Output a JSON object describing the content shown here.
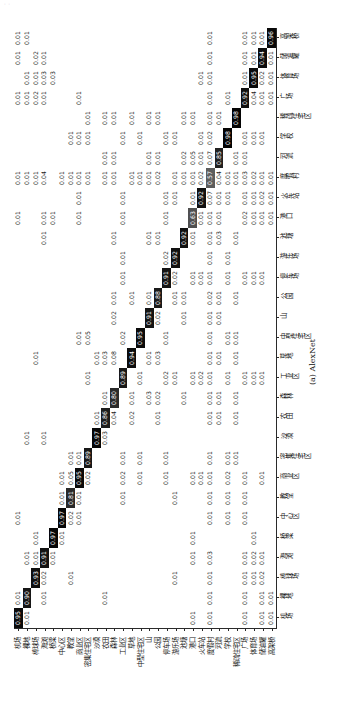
{
  "watermark_text": "  ·                                   ·            ",
  "figure": {
    "caption": "(a) AlexNet",
    "orientation_note": "rotated",
    "accent_dark": "#000000",
    "accent_light": "#ffffff"
  },
  "chart_data": {
    "type": "heatmap",
    "title": "",
    "subtitle": "(a) AlexNet",
    "xlabel": "",
    "ylabel": "",
    "grid": false,
    "legend": "none",
    "colormap": "greys",
    "vmin": 0,
    "vmax": 1,
    "categories": [
      "机场",
      "裸地",
      "棒球场",
      "海滩",
      "桥梁",
      "中心区",
      "教堂",
      "商业区",
      "密集住宅区",
      "沙漠",
      "农田",
      "森林",
      "工业区",
      "草地",
      "中型住宅区",
      "山",
      "公园",
      "停车场",
      "游乐场",
      "池塘",
      "港口",
      "火车站",
      "度假村",
      "河流",
      "学校",
      "稀疏住宅区",
      "广场",
      "体育场",
      "储油罐",
      "高架桥"
    ],
    "x_categories": [
      "机场",
      "裸地",
      "棒球场",
      "海滩",
      "桥梁",
      "中心区",
      "教堂",
      "商业区",
      "密集住宅区",
      "沙漠",
      "农田",
      "森林",
      "工业区",
      "草地",
      "中型住宅区",
      "山",
      "公园",
      "停车场",
      "游乐场",
      "池塘",
      "港口",
      "火车站",
      "度假村",
      "河流",
      "学校",
      "稀疏住宅区",
      "广场",
      "体育场",
      "储油罐",
      "高架桥"
    ],
    "y_categories": [
      "机场",
      "裸地",
      "棒球场",
      "海滩",
      "桥梁",
      "中心区",
      "教堂",
      "商业区",
      "密集住宅区",
      "沙漠",
      "农田",
      "森林",
      "工业区",
      "草地",
      "中型住宅区",
      "山",
      "公园",
      "停车场",
      "游乐场",
      "池塘",
      "港口",
      "火车站",
      "度假村",
      "河流",
      "学校",
      "稀疏住宅区",
      "广场",
      "体育场",
      "储油罐",
      "高架桥"
    ],
    "diagonal_values": [
      0.95,
      0.9,
      0.93,
      0.91,
      0.97,
      0.97,
      0.81,
      0.95,
      0.89,
      0.97,
      0.86,
      0.8,
      0.89,
      0.94,
      0.95,
      0.91,
      0.88,
      0.91,
      0.92,
      0.92,
      0.63,
      0.92,
      0.57,
      0.85,
      0.98,
      0.98,
      0.92,
      0.95,
      0.94,
      0.96
    ],
    "cells": [
      [
        "0.95",
        "0.01",
        "",
        "",
        "",
        "0.01",
        "",
        "",
        "",
        "",
        "",
        "",
        "",
        "",
        "",
        "",
        "",
        "",
        "",
        "",
        "0.01",
        "",
        "0.01",
        "",
        "",
        "",
        "0.01",
        "",
        "0.01",
        "0.01"
      ],
      [
        "0.01",
        "0.90",
        "",
        "0.01",
        "",
        "",
        "",
        "",
        "",
        "0.01",
        "",
        "",
        "",
        "",
        "",
        "",
        "",
        "",
        "",
        "",
        "",
        "",
        "0.01",
        "",
        "",
        "",
        "0.01",
        "0.01",
        "",
        "0.01"
      ],
      [
        "",
        "",
        "0.93",
        "0.01",
        "0.01",
        "",
        "",
        "",
        "",
        "",
        "",
        "",
        "",
        "0.01",
        "",
        "",
        "",
        "",
        "",
        "",
        "",
        "",
        "0.01",
        "",
        "",
        "",
        "0.02",
        "0.01",
        "0.02",
        ""
      ],
      [
        "",
        "0.01",
        "0.02",
        "0.91",
        "",
        "",
        "",
        "",
        "",
        "0.01",
        "",
        "",
        "",
        "",
        "",
        "",
        "",
        "",
        "",
        "0.01",
        "0.01",
        "",
        "0.04",
        "",
        "",
        "",
        "0.01",
        "0.03",
        "0.01",
        ""
      ],
      [
        "",
        "",
        "",
        "0.01",
        "0.97",
        "",
        "",
        "",
        "",
        "",
        "",
        "",
        "",
        "",
        "",
        "",
        "",
        "",
        "",
        "",
        "0.01",
        "",
        "",
        "",
        "",
        "",
        "",
        "0.03",
        ""
      ],
      [
        "",
        "",
        "",
        "",
        "0.01",
        "0.97",
        "0.01",
        "0.01",
        "",
        "",
        "",
        "",
        "",
        "",
        "",
        "",
        "",
        "",
        "",
        "",
        "",
        "",
        "0.01",
        "",
        "",
        "",
        "",
        "",
        ""
      ],
      [
        "",
        "",
        "0.01",
        "",
        "",
        "0.02",
        "0.81",
        "0.05",
        "0.01",
        "",
        "",
        "",
        "",
        "",
        "",
        "",
        "",
        "",
        "",
        "",
        "",
        "",
        "0.01",
        "",
        "0.01",
        "",
        "",
        "",
        "",
        ""
      ],
      [
        "",
        "",
        "",
        "",
        "",
        "0.01",
        "0.01",
        "0.95",
        "0.01",
        "",
        "",
        "",
        "",
        "",
        "0.01",
        "",
        "",
        "",
        "",
        "",
        "0.01",
        "0.01",
        "0.01",
        "",
        "0.01",
        "",
        "0.01",
        "",
        "",
        ""
      ],
      [
        "",
        "",
        "",
        "",
        "",
        "",
        "",
        "0.02",
        "0.89",
        "",
        "",
        "",
        "0.01",
        "",
        "0.05",
        "",
        "",
        "",
        "",
        "",
        "",
        "",
        "0.01",
        "",
        "0.01",
        "0.01",
        "",
        "",
        "",
        ""
      ],
      [
        "",
        "",
        "",
        "",
        "",
        "",
        "",
        "",
        "",
        "0.97",
        "0.01",
        "",
        "",
        "0.01",
        "",
        "",
        "",
        "",
        "",
        "",
        "",
        "",
        "",
        "",
        "",
        "",
        "",
        "",
        "",
        ""
      ],
      [
        "",
        "0.01",
        "",
        "",
        "",
        "",
        "",
        "",
        "",
        "0.03",
        "0.86",
        "0.01",
        "",
        "0.03",
        "",
        "",
        "",
        "",
        "",
        "",
        "",
        "",
        "0.01",
        "0.01",
        "",
        "0.01",
        "",
        "",
        "",
        ""
      ],
      [
        "",
        "",
        "",
        "",
        "",
        "",
        "",
        "",
        "",
        "",
        "0.04",
        "0.80",
        "",
        "0.08",
        "",
        "0.02",
        "0.01",
        "",
        "",
        "0.01",
        "",
        "",
        "0.01",
        "0.01",
        "",
        "0.01",
        "",
        "",
        "",
        ""
      ],
      [
        "",
        "",
        "",
        "",
        "",
        "",
        "0.01",
        "0.02",
        "0.01",
        "",
        "",
        "",
        "0.89",
        "",
        "0.02",
        "",
        "",
        "0.01",
        "0.01",
        "",
        "0.01",
        "0.01",
        "",
        "",
        "0.01",
        "",
        "",
        "",
        "",
        ""
      ],
      [
        "",
        "",
        "",
        "",
        "",
        "",
        "",
        "",
        "",
        "",
        "0.02",
        "0.01",
        "",
        "0.94",
        "",
        "",
        "0.01",
        "",
        "",
        "",
        "",
        "",
        "0.01",
        "",
        "",
        "0.01",
        "",
        "",
        "",
        ""
      ],
      [
        "",
        "",
        "",
        "",
        "",
        "",
        "",
        "0.01",
        "0.01",
        "",
        "",
        "",
        "0.01",
        "",
        "0.95",
        "",
        "",
        "",
        "",
        "",
        "",
        "",
        "0.01",
        "",
        "0.01",
        "",
        "",
        "",
        "",
        ""
      ],
      [
        "",
        "",
        "",
        "",
        "",
        "",
        "",
        "",
        "",
        "",
        "",
        "0.03",
        "",
        "0.01",
        "",
        "0.91",
        "0.01",
        "",
        "",
        "0.01",
        "",
        "",
        "0.01",
        "0.01",
        "",
        "0.01",
        "",
        "",
        "",
        ""
      ],
      [
        "",
        "",
        "",
        "",
        "",
        "",
        "",
        "",
        "",
        "",
        "0.01",
        "0.02",
        "",
        "0.03",
        "",
        "0.02",
        "0.88",
        "",
        "",
        "0.01",
        "",
        "",
        "0.02",
        "0.01",
        "",
        "0.01",
        "",
        "",
        "",
        ""
      ],
      [
        "",
        "",
        "",
        "",
        "",
        "",
        "",
        "0.01",
        "0.01",
        "",
        "",
        "",
        "0.02",
        "",
        "0.01",
        "",
        "",
        "0.91",
        "0.02",
        "",
        "0.01",
        "0.01",
        "",
        "",
        "0.01",
        "",
        "",
        "",
        "",
        ""
      ],
      [
        "",
        "",
        "0.01",
        "",
        "",
        "",
        "0.01",
        "",
        "",
        "",
        "",
        "",
        "0.01",
        "",
        "",
        "",
        "0.01",
        "0.02",
        "0.92",
        "",
        "",
        "0.01",
        "0.01",
        "",
        "0.01",
        "",
        "",
        "",
        "",
        ""
      ],
      [
        "",
        "",
        "",
        "",
        "",
        "",
        "",
        "",
        "",
        "",
        "",
        "0.01",
        "",
        "",
        "",
        "0.01",
        "0.01",
        "",
        "",
        "0.92",
        "",
        "",
        "0.01",
        "0.02",
        "",
        "0.01",
        "",
        "",
        "",
        ""
      ],
      [
        "0.01",
        "",
        "",
        "0.01",
        "0.01",
        "",
        "",
        "0.01",
        "",
        "",
        "",
        "",
        "0.01",
        "",
        "",
        "",
        "",
        "0.01",
        "",
        "0.01",
        "0.63",
        "0.01",
        "0.01",
        "0.05",
        "",
        "0.01",
        "",
        "",
        "",
        ""
      ],
      [
        "",
        "",
        "",
        "",
        "",
        "",
        "",
        "0.01",
        "",
        "",
        "",
        "",
        "0.02",
        "",
        "",
        "",
        "",
        "0.01",
        "",
        "",
        "0.01",
        "0.92",
        "0.02",
        "0.01",
        "0.01",
        "",
        "",
        "0.01",
        "",
        ""
      ],
      [
        "0.01",
        "0.01",
        "0.01",
        "0.03",
        "",
        "0.01",
        "0.01",
        "0.01",
        "0.01",
        "",
        "0.01",
        "0.01",
        "0.01",
        "0.01",
        "0.01",
        "0.01",
        "0.02",
        "0.01",
        "0.01",
        "0.01",
        "0.01",
        "0.07",
        "0.57",
        "0.07",
        "0.02",
        "0.01",
        "0.01",
        "0.01",
        "0.01",
        "0.01"
      ],
      [
        "",
        "",
        "",
        "",
        "",
        "",
        "",
        "",
        "",
        "",
        "0.01",
        "0.01",
        "",
        "0.01",
        "",
        "0.01",
        "0.01",
        "",
        "",
        "0.03",
        "0.01",
        "0.01",
        "0.04",
        "0.85",
        "",
        "0.01",
        "",
        "",
        "",
        ""
      ],
      [
        "",
        "",
        "",
        "",
        "",
        "0.01",
        "0.01",
        "0.02",
        "0.01",
        "",
        "",
        "",
        "0.01",
        "",
        "0.01",
        "",
        "",
        "0.01",
        "0.01",
        "",
        "",
        "0.01",
        "0.01",
        "",
        "0.98",
        "",
        "0.01",
        "",
        "",
        ""
      ],
      [
        "",
        "",
        "",
        "",
        "",
        "",
        "",
        "",
        "0.01",
        "",
        "0.01",
        "0.01",
        "",
        "0.01",
        "0.01",
        "",
        "0.01",
        "",
        "",
        "0.01",
        "",
        "",
        "0.01",
        "0.01",
        "",
        "0.98",
        "",
        "",
        "",
        ""
      ],
      [
        "0.01",
        "0.01",
        "0.01",
        "0.01",
        "",
        "0.01",
        "0.01",
        "0.01",
        "",
        "",
        "",
        "",
        "0.01",
        "",
        "",
        "",
        "",
        "0.01",
        "",
        "",
        "0.02",
        "0.01",
        "0.03",
        "0.01",
        "0.01",
        "",
        "0.92",
        "0.01",
        "0.01",
        "0.01"
      ],
      [
        "",
        "",
        "0.01",
        "0.02",
        "0.01",
        "",
        "",
        "",
        "",
        "",
        "",
        "",
        "0.01",
        "",
        "",
        "",
        "",
        "0.01",
        "",
        "",
        "0.01",
        "0.01",
        "0.02",
        "",
        "0.01",
        "",
        "0.04",
        "0.95",
        "0.01",
        "0.01"
      ],
      [
        "0.01",
        "0.01",
        "0.02",
        "0.01",
        "",
        "",
        "",
        "0.01",
        "",
        "",
        "",
        "",
        "0.01",
        "",
        "",
        "",
        "",
        "0.01",
        "",
        "",
        "0.01",
        "0.02",
        "0.01",
        "",
        "0.01",
        "",
        "0.01",
        "0.02",
        "0.94",
        "0.01"
      ],
      [
        "0.01",
        "0.01",
        "",
        "",
        "",
        "",
        "",
        "",
        "",
        "",
        "",
        "",
        "",
        "",
        "",
        "",
        "",
        "",
        "",
        "",
        "0.01",
        "0.01",
        "0.01",
        "",
        "",
        "",
        "0.01",
        "0.01",
        "0.01",
        "0.96"
      ]
    ]
  }
}
